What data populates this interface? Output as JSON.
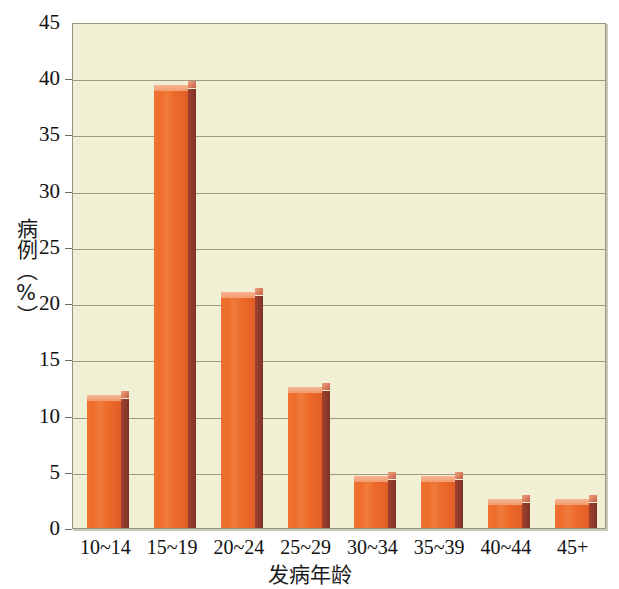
{
  "chart_data": {
    "type": "bar",
    "title": "",
    "subtitle": "",
    "xlabel": "发病年龄",
    "ylabel": "病例（%）",
    "categories": [
      "10~14",
      "15~19",
      "20~24",
      "25~29",
      "30~34",
      "35~39",
      "40~44",
      "45+"
    ],
    "values": [
      11.8,
      39.4,
      21.0,
      12.5,
      4.6,
      4.6,
      2.6,
      2.6
    ],
    "ylim": [
      0,
      45
    ],
    "xlim_note": "categorical",
    "ytick_labels": [
      "0",
      "5",
      "10",
      "15",
      "20",
      "25",
      "30",
      "35",
      "40",
      "45"
    ],
    "ytick_values": [
      0,
      5,
      10,
      15,
      20,
      25,
      30,
      35,
      40,
      45
    ],
    "grid": "horizontal",
    "legend": "none",
    "annotations": [],
    "colors": {
      "bar_face": "#ed6e2a",
      "bar_side": "#8d3a2c",
      "bar_top": "#f5a477",
      "plot_background": "#f2f0d4",
      "gridline": "#8e8a74",
      "plot_border": "#9a9580",
      "page_background": "#ffffff",
      "text": "#111111"
    }
  },
  "axes": {
    "y_title": "病例（%）",
    "x_title": "发病年龄"
  }
}
